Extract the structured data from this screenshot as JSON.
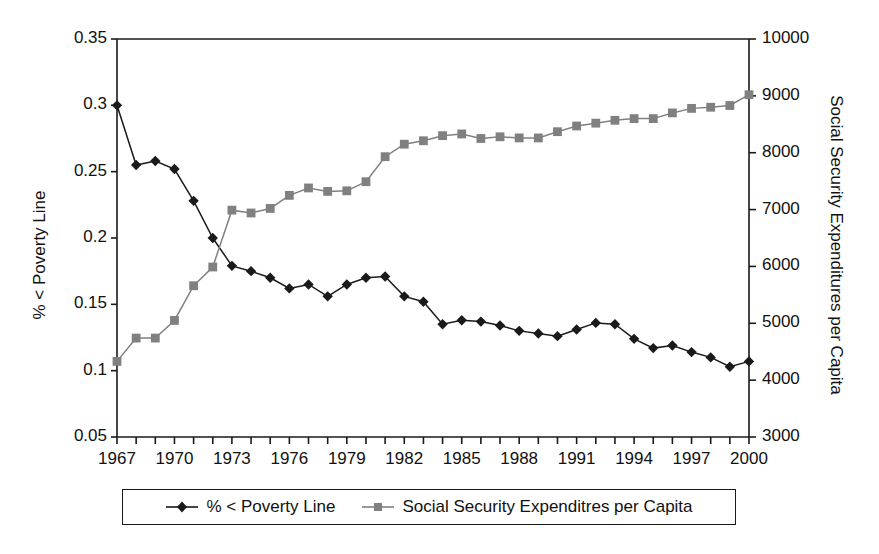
{
  "chart_data": {
    "type": "line",
    "title": "",
    "xlabel": "",
    "ylabel": "% < Poverty Line",
    "ylabel_secondary": "Social Security Expenditures per Capita",
    "grid": false,
    "legend_position": "bottom",
    "xlim": [
      1967,
      2000
    ],
    "ylim": [
      0.05,
      0.35
    ],
    "ylim_secondary": [
      3000,
      10000
    ],
    "x": [
      1967,
      1968,
      1969,
      1970,
      1971,
      1972,
      1973,
      1974,
      1975,
      1976,
      1977,
      1978,
      1979,
      1980,
      1981,
      1982,
      1983,
      1984,
      1985,
      1986,
      1987,
      1988,
      1989,
      1990,
      1991,
      1992,
      1993,
      1994,
      1995,
      1996,
      1997,
      1998,
      1999,
      2000
    ],
    "series": [
      {
        "name": "% < Poverty Line",
        "axis": "left",
        "color": "#1a1a1a",
        "marker": "diamond",
        "values": [
          0.3,
          0.255,
          0.258,
          0.252,
          0.228,
          0.2,
          0.179,
          0.175,
          0.17,
          0.162,
          0.165,
          0.156,
          0.165,
          0.17,
          0.171,
          0.156,
          0.152,
          0.135,
          0.138,
          0.137,
          0.134,
          0.13,
          0.128,
          0.126,
          0.131,
          0.136,
          0.135,
          0.124,
          0.117,
          0.119,
          0.114,
          0.11,
          0.103,
          0.107
        ]
      },
      {
        "name": "Social Security Expenditres per Capita",
        "axis": "right",
        "color": "#808080",
        "marker": "square",
        "values": [
          4330,
          4740,
          4740,
          5050,
          5660,
          5990,
          6990,
          6940,
          7020,
          7250,
          7380,
          7320,
          7330,
          7490,
          7930,
          8150,
          8210,
          8300,
          8330,
          8250,
          8280,
          8260,
          8260,
          8370,
          8470,
          8520,
          8570,
          8600,
          8600,
          8700,
          8780,
          8800,
          8830,
          9020
        ]
      }
    ],
    "xticks": [
      1967,
      1970,
      1973,
      1976,
      1979,
      1982,
      1985,
      1988,
      1991,
      1994,
      1997,
      2000
    ],
    "yticks_left": [
      "0.05",
      "0.1",
      "0.15",
      "0.2",
      "0.25",
      "0.3",
      "0.35"
    ],
    "yticks_right": [
      "3000",
      "4000",
      "5000",
      "6000",
      "7000",
      "8000",
      "9000",
      "10000"
    ]
  },
  "legend": {
    "entries": [
      {
        "label": "% < Poverty Line",
        "marker": "diamond",
        "color": "#1a1a1a"
      },
      {
        "label": "Social Security Expenditres per Capita",
        "marker": "square",
        "color": "#808080"
      }
    ]
  },
  "axes": {
    "left_title": "% < Poverty Line",
    "right_title": "Social Security Expenditures per Capita"
  },
  "colors": {
    "poverty_series": "#1a1a1a",
    "social_security_series": "#808080",
    "frame": "#1a1a1a",
    "background": "#ffffff"
  }
}
